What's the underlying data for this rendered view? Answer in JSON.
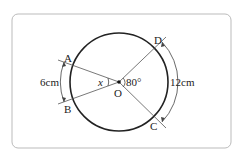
{
  "figure": {
    "center_label": "O",
    "points": {
      "A": "A",
      "B": "B",
      "C": "C",
      "D": "D"
    },
    "angle_unknown": "x",
    "angle_given": "80°",
    "arc_AB_length": "6cm",
    "arc_CD_length": "12cm"
  },
  "colors": {
    "frame": "#bbbbbb",
    "circle": "#222222",
    "lines": "#555555"
  }
}
